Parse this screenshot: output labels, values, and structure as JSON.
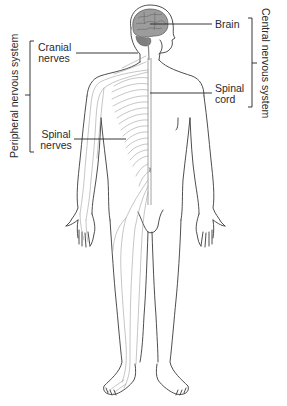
{
  "figure": {
    "title": "",
    "colors": {
      "outline": "#3a3a3a",
      "nerves": "#9a9a9a",
      "brain_fill": "#9c9c9c",
      "brain_dark": "#6e6e6e",
      "label_text": "#2a2a2a",
      "leader_line": "#222222"
    }
  },
  "groups": {
    "peripheral": {
      "label": "Peripheral nervous system",
      "side": "left"
    },
    "central": {
      "label": "Central nervous system",
      "side": "right"
    }
  },
  "labels": {
    "cranial_nerves": {
      "line1": "Cranial",
      "line2": "nerves",
      "group": "peripheral"
    },
    "spinal_nerves": {
      "line1": "Spinal",
      "line2": "nerves",
      "group": "peripheral"
    },
    "brain": {
      "line1": "Brain",
      "group": "central"
    },
    "spinal_cord": {
      "line1": "Spinal",
      "line2": "cord",
      "group": "central"
    }
  }
}
